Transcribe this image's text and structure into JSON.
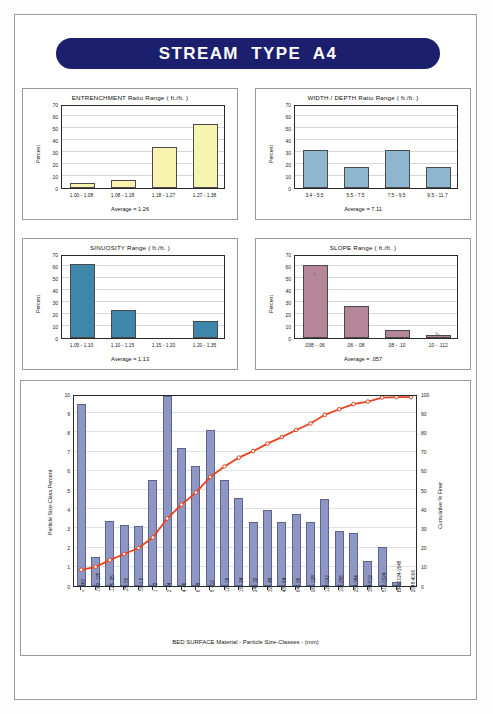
{
  "header": {
    "title": "STREAM  TYPE  A4"
  },
  "panels": [
    {
      "id": "entrenchment",
      "title": "ENTRENCHMENT Ratio Range ( ft./ft. )",
      "ylabel": "Percent",
      "average_label": "Average =  1.26",
      "bar_color": "#f7f4b0",
      "chart_data": {
        "type": "bar",
        "title": "ENTRENCHMENT Ratio Range ( ft./ft. )",
        "xlabel": "",
        "ylabel": "Percent",
        "ylim": [
          0,
          70
        ],
        "yticks": [
          0,
          10,
          20,
          30,
          40,
          50,
          60,
          70
        ],
        "categories": [
          "1.00 - 1.08",
          "1.08 - 1.18",
          "1.18 - 1.27",
          "1.27 - 1.38"
        ],
        "values": [
          4,
          6.5,
          34.5,
          53
        ],
        "grid": true,
        "legend": "none"
      }
    },
    {
      "id": "width-depth",
      "title": "WIDTH / DEPTH Ratio Range ( ft./ft. )",
      "ylabel": "Percent",
      "average_label": "Average =  7.11",
      "bar_color": "#8fb6cf",
      "chart_data": {
        "type": "bar",
        "title": "WIDTH / DEPTH Ratio Range ( ft./ft. )",
        "xlabel": "",
        "ylabel": "Percent",
        "ylim": [
          0,
          70
        ],
        "yticks": [
          0,
          10,
          20,
          30,
          40,
          50,
          60,
          70
        ],
        "categories": [
          "3.4 - 5.5",
          "5.5 - 7.5",
          "7.5 - 9.5",
          "9.5 - 11.7"
        ],
        "values": [
          32,
          17.5,
          32,
          17.5
        ],
        "grid": true,
        "legend": "none"
      }
    },
    {
      "id": "sinuosity",
      "title": "SINUOSITY  Range ( ft./ft. )",
      "ylabel": "Percent",
      "average_label": "Average =  1.13",
      "bar_color": "#3f87aa",
      "chart_data": {
        "type": "bar",
        "title": "SINUOSITY  Range ( ft./ft. )",
        "xlabel": "",
        "ylabel": "Percent",
        "ylim": [
          0,
          70
        ],
        "yticks": [
          0,
          10,
          20,
          30,
          40,
          50,
          60,
          70
        ],
        "categories": [
          "1.05 - 1.10",
          "1.10 - 1.15",
          "1.15 - 1.20",
          "1.20 - 1.35"
        ],
        "values": [
          61.5,
          23,
          0,
          14
        ],
        "grid": true,
        "legend": "none"
      }
    },
    {
      "id": "slope",
      "title": "SLOPE  Range ( ft./ft. )",
      "ylabel": "Percent",
      "average_label": "Average =  .057",
      "bar_color": "#b58698",
      "bar_notes": [
        "5",
        "",
        "",
        "3+"
      ],
      "chart_data": {
        "type": "bar",
        "title": "SLOPE  Range ( ft./ft. )",
        "xlabel": "",
        "ylabel": "Percent",
        "ylim": [
          0,
          70
        ],
        "yticks": [
          0,
          10,
          20,
          30,
          40,
          50,
          60,
          70
        ],
        "categories": [
          ".038 - .06",
          ".06 - .08",
          ".08 - .10",
          ".10 - .112"
        ],
        "values": [
          61,
          26.5,
          7,
          2.5
        ],
        "annotations": [
          "5",
          "",
          "",
          "3+"
        ],
        "grid": true,
        "legend": "none"
      }
    }
  ],
  "bottom": {
    "ylabel_left": "Particle Size-Class Percent",
    "ylabel_right": "Cumulative % Finer",
    "xtitle": "BED SURFACE Material  -  Particle Size-Classes  -  (mm)",
    "bar_color": "#8e96c4",
    "line_color": "#e8431f",
    "chart_data": {
      "type": "bar",
      "title": "",
      "xlabel": "BED SURFACE Material  -  Particle Size-Classes  -  (mm)",
      "ylabel": "Particle Size-Class Percent",
      "ylabel_secondary": "Cumulative % Finer",
      "ylim": [
        0,
        10
      ],
      "yticks": [
        0,
        1,
        2,
        3,
        4,
        5,
        6,
        7,
        8,
        9,
        10
      ],
      "ylim_secondary": [
        0,
        100
      ],
      "yticks_secondary": [
        0,
        10,
        20,
        30,
        40,
        50,
        60,
        70,
        80,
        90,
        100
      ],
      "grid": true,
      "legend": "none",
      "categories": [
        "< .062",
        ".062-.125",
        ".125-.25",
        ".25-.50",
        ".50-1.0",
        "1 - 2",
        "2 - 4",
        "4 - 6",
        "6 - 8",
        "8 - 12",
        "12 - 16",
        "16 - 24",
        "24 - 32",
        "32 - 48",
        "48 - 64",
        "64 - 96",
        "96 - 128",
        "128-192",
        "192-256",
        "256-384",
        "384-512",
        "512-1024",
        "BR&1024-2048",
        "2048-4096"
      ],
      "series": [
        {
          "name": "Particle Size-Class Percent",
          "type": "bar",
          "axis": "left",
          "values": [
            9.5,
            1.5,
            3.4,
            3.2,
            3.1,
            5.5,
            9.9,
            7.2,
            6.25,
            8.15,
            5.5,
            4.6,
            3.35,
            3.95,
            3.35,
            3.75,
            3.35,
            4.55,
            2.85,
            2.75,
            1.3,
            2.05,
            0.2,
            0
          ]
        },
        {
          "name": "Cumulative % Finer",
          "type": "line",
          "axis": "right",
          "values": [
            9.5,
            11,
            14.5,
            17.7,
            20.8,
            26.3,
            36.2,
            43.4,
            49.7,
            57.8,
            63.3,
            67.9,
            71.3,
            75.2,
            78.6,
            82.3,
            85.7,
            90.2,
            93.1,
            95.8,
            97.1,
            99.2,
            99.4,
            99.4
          ]
        }
      ]
    }
  }
}
